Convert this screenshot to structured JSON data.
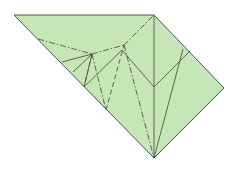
{
  "diagram": {
    "type": "origami-crease-pattern",
    "paper_color": "#c6e6b8",
    "line_color": "#4a5a48",
    "outline": [
      [
        14,
        15
      ],
      [
        154,
        15
      ],
      [
        224,
        88
      ],
      [
        154,
        158
      ]
    ],
    "valley_lines": [
      [
        [
          154,
          15
        ],
        [
          154,
          158
        ]
      ],
      [
        [
          84,
          87
        ],
        [
          122,
          50
        ]
      ],
      [
        [
          122,
          50
        ],
        [
          154,
          87
        ]
      ],
      [
        [
          154,
          87
        ],
        [
          190,
          51
        ]
      ],
      [
        [
          154,
          158
        ],
        [
          183,
          49
        ]
      ],
      [
        [
          62,
          62
        ],
        [
          92,
          54
        ]
      ],
      [
        [
          73,
          72
        ],
        [
          92,
          54
        ]
      ],
      [
        [
          92,
          54
        ],
        [
          84,
          87
        ]
      ]
    ],
    "mountain_lines": [
      [
        [
          38,
          39
        ],
        [
          92,
          54
        ]
      ],
      [
        [
          92,
          54
        ],
        [
          124,
          45
        ]
      ],
      [
        [
          124,
          45
        ],
        [
          154,
          15
        ]
      ],
      [
        [
          92,
          54
        ],
        [
          106,
          110
        ]
      ],
      [
        [
          124,
          45
        ],
        [
          154,
          158
        ]
      ]
    ],
    "dashed_lines": [
      [
        [
          106,
          110
        ],
        [
          124,
          45
        ]
      ],
      [
        [
          92,
          54
        ],
        [
          84,
          87
        ]
      ]
    ]
  }
}
